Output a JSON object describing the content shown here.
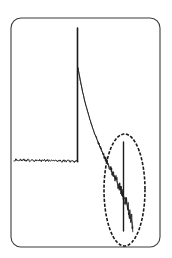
{
  "figure": {
    "background_color": "#ffffff",
    "frame": {
      "name": "plot-frame",
      "x": 11,
      "y": 18,
      "width": 149,
      "height": 229,
      "corner_radius": 10,
      "stroke_color": "#3a3a3a",
      "stroke_width": 1.1,
      "fill_color": "#ffffff"
    },
    "annotation": {
      "name": "region-of-interest-ellipse",
      "shape": "ellipse",
      "center_x": 124.5,
      "center_y": 190,
      "radius_x": 20.5,
      "radius_y": 56,
      "stroke_color": "#1a1a1a",
      "stroke_width": 1.6,
      "dash_pattern": "1.6 3.2",
      "fill": "none"
    },
    "trace_color": "#1a1a1a",
    "trace_width": 0.9
  },
  "chart_data": {
    "type": "line",
    "subtitle": "",
    "xlabel": "",
    "ylabel": "",
    "xlim": [
      0,
      149
    ],
    "ylim": [
      247,
      18
    ],
    "grid": false,
    "legend": null,
    "axis_ticks_visible": false,
    "tick_labels": [],
    "annotations": [
      {
        "type": "ellipse",
        "label": "region of interest",
        "center": [
          124.5,
          190
        ],
        "radii": [
          20.5,
          56
        ],
        "style": "dashed"
      }
    ],
    "series": [
      {
        "name": "baseline-noise",
        "description": "Flat noisy baseline before the main pulse",
        "noise_amplitude": 1.6,
        "points": [
          [
            14,
            160.5
          ],
          [
            16,
            159.6
          ],
          [
            18,
            160.8
          ],
          [
            20,
            159.8
          ],
          [
            22,
            160.6
          ],
          [
            24,
            159.7
          ],
          [
            26,
            160.9
          ],
          [
            28,
            160.0
          ],
          [
            30,
            160.7
          ],
          [
            32,
            159.8
          ],
          [
            34,
            160.9
          ],
          [
            36,
            160.1
          ],
          [
            38,
            160.8
          ],
          [
            40,
            159.9
          ],
          [
            42,
            161.0
          ],
          [
            44,
            160.2
          ],
          [
            46,
            161.0
          ],
          [
            48,
            160.1
          ],
          [
            50,
            161.2
          ],
          [
            52,
            160.3
          ],
          [
            54,
            161.1
          ],
          [
            56,
            160.4
          ],
          [
            58,
            161.3
          ],
          [
            60,
            160.5
          ],
          [
            62,
            161.4
          ],
          [
            64,
            160.6
          ],
          [
            66,
            161.5
          ],
          [
            68,
            160.8
          ],
          [
            70,
            161.6
          ],
          [
            72,
            160.9
          ],
          [
            74,
            161.7
          ],
          [
            76,
            161.0
          ],
          [
            78,
            161.8
          ]
        ]
      },
      {
        "name": "main-pulse",
        "description": "Tall narrow vertical spike rising from baseline",
        "x": 77.5,
        "y_top": 28,
        "y_bottom": 161.8,
        "peak_height": 133.8,
        "width": 1.6
      },
      {
        "name": "decay-noise",
        "description": "Exponentially decaying noisy trace after the pulse, broadening toward the lower right",
        "points": [
          [
            78,
            68
          ],
          [
            80,
            79
          ],
          [
            82,
            89
          ],
          [
            84,
            98
          ],
          [
            86,
            106
          ],
          [
            88,
            113
          ],
          [
            90,
            120
          ],
          [
            92,
            126
          ],
          [
            94,
            132
          ],
          [
            96,
            137
          ],
          [
            98,
            142
          ],
          [
            100,
            147
          ],
          [
            102,
            151
          ],
          [
            104,
            156
          ],
          [
            106,
            160
          ],
          [
            108,
            164
          ],
          [
            110,
            168
          ],
          [
            112,
            172
          ],
          [
            114,
            176
          ],
          [
            116,
            180
          ],
          [
            118,
            184
          ],
          [
            120,
            188
          ],
          [
            122,
            192
          ],
          [
            124,
            197
          ],
          [
            126,
            202
          ],
          [
            128,
            208
          ],
          [
            130,
            215
          ],
          [
            132,
            222
          ],
          [
            133,
            228
          ]
        ],
        "noise_amplitude_start": 0.6,
        "noise_amplitude_end": 9.0
      },
      {
        "name": "secondary-pulse",
        "description": "Narrow secondary spike inside the highlighted ellipse",
        "x": 123.5,
        "y_top": 142,
        "y_bottom": 231,
        "peak_height": 89,
        "width": 1.4
      }
    ]
  }
}
